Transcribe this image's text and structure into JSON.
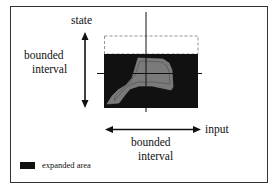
{
  "labels": {
    "state": "state",
    "vertical_interval_line1": "bounded",
    "vertical_interval_line2": "interval",
    "input": "input",
    "horizontal_interval_line1": "bounded",
    "horizontal_interval_line2": "interval"
  },
  "legend": {
    "expanded_area": "expanded area"
  },
  "colors": {
    "expanded_area": "#111111",
    "inner_region": "#7a7a7a",
    "frame": "#333333",
    "dashed_box": "#888888"
  }
}
